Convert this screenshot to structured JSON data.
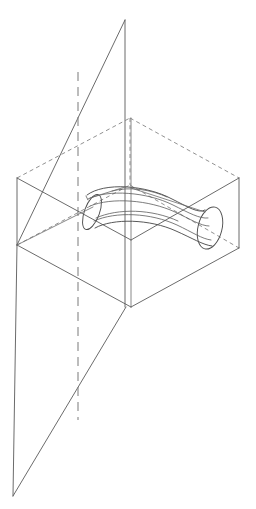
{
  "figure": {
    "domain_label": "technical-line-drawing",
    "background_color": "#ffffff",
    "stroke_color_solid": "#5a5a5a",
    "stroke_color_hidden": "#7d7d7d",
    "stroke_color_axis": "#808080",
    "canvas": {
      "width": 256,
      "height": 509
    },
    "caption": ""
  },
  "geometry": {
    "box": {
      "name": "bounding-parallelepiped",
      "vertices": {
        "left_bottom": [
          17,
          245
        ],
        "left_top": [
          17,
          178
        ],
        "front_bottom": [
          131,
          307
        ],
        "front_top": [
          131,
          240
        ],
        "right_bottom": [
          239,
          248
        ],
        "right_top": [
          239,
          178
        ],
        "back_bottom": [
          130,
          185
        ],
        "back_top": [
          130,
          118
        ]
      },
      "visible_edges": [
        "left_bottom-front_bottom",
        "front_bottom-right_bottom",
        "left_bottom-left_top",
        "front_bottom-front_top",
        "right_bottom-right_top",
        "left_top-front_top",
        "front_top-right_top"
      ],
      "hidden_edges": [
        "left_bottom-back_bottom",
        "back_bottom-right_bottom",
        "left_top-back_top",
        "back_top-right_top",
        "back_bottom-back_top"
      ]
    },
    "cutting_plane": {
      "name": "large-slanted-plane",
      "vertices": [
        [
          125,
          20
        ],
        [
          17,
          245
        ],
        [
          13,
          496
        ],
        [
          126,
          307
        ]
      ],
      "style": "solid outline, unfilled"
    },
    "vertical_axis_pair": {
      "name": "vertical-axis-strip",
      "line_left": [
        [
          125,
          20
        ],
        [
          125,
          307
        ]
      ],
      "line_right": [
        [
          131,
          118
        ],
        [
          131,
          307
        ]
      ]
    },
    "revolution_axis": {
      "name": "dashed-axis-of-revolution",
      "from": [
        78,
        72
      ],
      "to": [
        78,
        420
      ],
      "style": "long-dash"
    },
    "tube": {
      "name": "curved-tapered-tube",
      "left_cap_center": [
        92,
        211
      ],
      "left_cap_rx": 7,
      "left_cap_ry": 18,
      "left_cap_rotation_deg": 20,
      "right_cap_center": [
        211,
        228
      ],
      "right_cap_rx": 12,
      "right_cap_ry": 22,
      "right_cap_rotation_deg": 14,
      "upper_silhouette": "arc from left cap top over centre to right cap top",
      "lower_silhouette": "arc from left cap bottom under centre to right cap bottom",
      "interior_contours": 4
    }
  },
  "labels": {
    "items": []
  }
}
